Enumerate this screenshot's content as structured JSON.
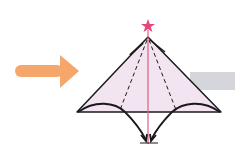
{
  "diagram": {
    "type": "origami-fold-step",
    "colors": {
      "background": "#ffffff",
      "paper_fill": "#f3e4f1",
      "outline": "#1a1a1a",
      "center_line": "#e0607e",
      "star": "#e8457a",
      "arrow": "#f5a66a",
      "gray_band": "#d4d6dc"
    },
    "elements": {
      "direction_arrow": "right-arrow",
      "star_marker": "star-icon",
      "fold_arrows": 2
    }
  }
}
